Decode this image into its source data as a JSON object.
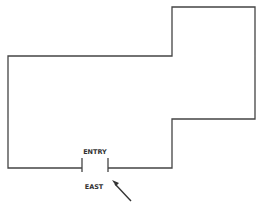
{
  "diagram": {
    "type": "floor-plan-outline",
    "entry_label": "ENTRY",
    "direction_label": "EAST",
    "colors": {
      "wall": "#444444",
      "text": "#333333",
      "background": "#ffffff"
    },
    "elements": [
      "building-outline",
      "entry-door-gap",
      "entry-arrow"
    ]
  }
}
